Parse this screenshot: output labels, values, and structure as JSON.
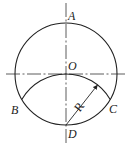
{
  "diagram": {
    "type": "geometry-construction",
    "labels": {
      "A": "A",
      "O": "O",
      "B": "B",
      "C": "C",
      "D": "D",
      "R": "R"
    },
    "elements": {
      "main_circle": {
        "center": "O",
        "through": [
          "A",
          "B",
          "C",
          "D"
        ]
      },
      "arc": {
        "center": "D",
        "from": "B",
        "to": "C",
        "through": "O",
        "radius_label": "R"
      },
      "center_lines": [
        "horizontal through O",
        "vertical through A, O, D"
      ]
    },
    "colors": {
      "stroke": "#222222",
      "background": "#ffffff"
    }
  }
}
